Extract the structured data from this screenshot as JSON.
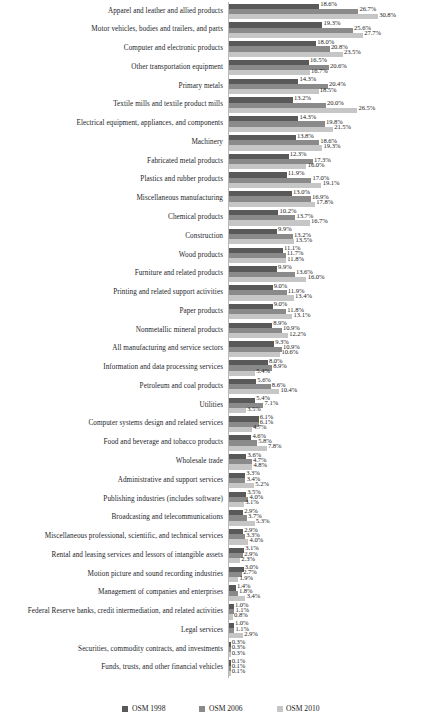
{
  "chart_data": {
    "type": "bar",
    "orientation": "horizontal",
    "title": "",
    "subtitle": "",
    "xlabel": "",
    "ylabel": "",
    "grid": false,
    "axis_labels_visible": false,
    "value_labels": true,
    "value_label_format": "percent_one_decimal",
    "legend_position": "bottom-center",
    "xlim": [
      0,
      30.8
    ],
    "categories": [
      "Apparel and leather and allied products",
      "Motor vehicles, bodies and  trailers, and parts",
      "Computer and electronic products",
      "Other transportation equipment",
      "Primary metals",
      "Textile mills and textile product mills",
      "Electrical equipment, appliances, and components",
      "Machinery",
      "Fabricated metal products",
      "Plastics and rubber products",
      "Miscellaneous manufacturing",
      "Chemical products",
      "Construction",
      "Wood products",
      "Furniture and related products",
      "Printing and related support activities",
      "Paper products",
      "Nonmetallic mineral products",
      "All manufacturing and service sectors",
      "Information and data processing services",
      "Petroleum and coal products",
      "Utilities",
      "Computer systems design and related services",
      "Food and beverage and tobacco products",
      "Wholesale trade",
      "Administrative and support services",
      "Publishing industries (includes software)",
      "Broadcasting and telecommunications",
      "Miscellaneous professional, scientific, and technical services",
      "Rental and leasing services and lessors of intangible assets",
      "Motion picture and sound recording industries",
      "Management of companies and enterprises",
      "Federal Reserve banks, credit intermediation, and related activities",
      "Legal services",
      "Securities, commodity contracts, and investments",
      "Funds, trusts, and other financial vehicles"
    ],
    "series": [
      {
        "name": "OSM 1998",
        "color": "#595959",
        "values": [
          18.6,
          19.3,
          18.0,
          16.5,
          14.3,
          13.2,
          14.3,
          13.8,
          12.3,
          11.9,
          13.0,
          10.2,
          9.9,
          11.1,
          9.9,
          9.0,
          9.0,
          8.9,
          9.3,
          8.0,
          5.6,
          5.4,
          6.1,
          4.6,
          3.6,
          3.3,
          3.5,
          2.9,
          2.9,
          3.1,
          3.0,
          1.4,
          1.0,
          1.0,
          0.3,
          0.1
        ]
      },
      {
        "name": "OSM 2006",
        "color": "#8a8a8a",
        "values": [
          26.7,
          25.6,
          20.8,
          20.6,
          20.4,
          20.0,
          19.8,
          18.6,
          17.3,
          17.0,
          16.9,
          13.7,
          13.2,
          11.7,
          13.6,
          11.9,
          11.8,
          10.9,
          10.9,
          8.9,
          8.6,
          7.1,
          6.1,
          5.8,
          4.7,
          3.4,
          4.0,
          3.7,
          3.3,
          2.9,
          2.7,
          1.8,
          1.1,
          1.1,
          0.3,
          0.1
        ]
      },
      {
        "name": "OSM 2010",
        "color": "#c6c6c6",
        "values": [
          30.8,
          27.7,
          23.5,
          16.7,
          18.5,
          26.5,
          21.5,
          19.3,
          16.0,
          19.1,
          17.8,
          16.7,
          13.5,
          11.8,
          16.0,
          13.4,
          13.1,
          12.2,
          10.6,
          5.4,
          10.4,
          3.5,
          4.7,
          7.8,
          4.8,
          5.2,
          3.1,
          5.3,
          4.0,
          2.3,
          1.9,
          3.4,
          0.8,
          2.9,
          0.3,
          0.1
        ]
      }
    ],
    "value_label_strings": [
      [
        "18.6%",
        "26.7%",
        "30.8%"
      ],
      [
        "19.3%",
        "25.6%",
        "27.7%"
      ],
      [
        "18.0%",
        "20.8%",
        "23.5%"
      ],
      [
        "16.5%",
        "20.6%",
        "16.7%"
      ],
      [
        "14.3%",
        "20.4%",
        "18.5%"
      ],
      [
        "13.2%",
        "20.0%",
        "26.5%"
      ],
      [
        "14.3%",
        "19.8%",
        "21.5%"
      ],
      [
        "13.8%",
        "18.6%",
        "19.3%"
      ],
      [
        "12.3%",
        "17.3%",
        "16.0%"
      ],
      [
        "11.9%",
        "17.0%",
        "19.1%"
      ],
      [
        "13.0%",
        "16.9%",
        "17.8%"
      ],
      [
        "10.2%",
        "13.7%",
        "16.7%"
      ],
      [
        "9.9%",
        "13.2%",
        "13.5%"
      ],
      [
        "11.1%",
        "11.7%",
        "11.8%"
      ],
      [
        "9.9%",
        "13.6%",
        "16.0%"
      ],
      [
        "9.0%",
        "11.9%",
        "13.4%"
      ],
      [
        "9.0%",
        "11.8%",
        "13.1%"
      ],
      [
        "8.9%",
        "10.9%",
        "12.2%"
      ],
      [
        "9.3%",
        "10.9%",
        "10.6%"
      ],
      [
        "8.0%",
        "8.9%",
        "5.4%"
      ],
      [
        "5.6%",
        "8.6%",
        "10.4%"
      ],
      [
        "5.4%",
        "7.1%",
        "3.5%"
      ],
      [
        "6.1%",
        "6.1%",
        "4.7%"
      ],
      [
        "4.6%",
        "5.8%",
        "7.8%"
      ],
      [
        "3.6%",
        "4.7%",
        "4.8%"
      ],
      [
        "3.3%",
        "3.4%",
        "5.2%"
      ],
      [
        "3.5%",
        "4.0%",
        "3.1%"
      ],
      [
        "2.9%",
        "3.7%",
        "5.3%"
      ],
      [
        "2.9%",
        "3.3%",
        "4.0%"
      ],
      [
        "3.1%",
        "2.9%",
        "2.3%"
      ],
      [
        "3.0%",
        "2.7%",
        "1.9%"
      ],
      [
        "1.4%",
        "1.8%",
        "3.4%"
      ],
      [
        "1.0%",
        "1.1%",
        "0.8%"
      ],
      [
        "1.0%",
        "1.1%",
        "2.9%"
      ],
      [
        "0.3%",
        "0.3%",
        "0.3%"
      ],
      [
        "0.1%",
        "0.1%",
        "0.1%"
      ]
    ]
  },
  "legend": {
    "items": [
      {
        "label": "OSM 1998"
      },
      {
        "label": "OSM 2006"
      },
      {
        "label": "OSM 2010"
      }
    ]
  }
}
